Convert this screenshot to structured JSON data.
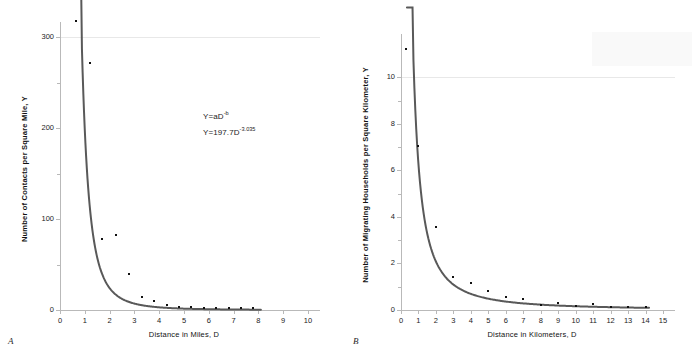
{
  "figure": {
    "background": "#ffffff",
    "curve_color": "#595959",
    "marker_color": "#111111",
    "axis_color": "#b9b9b9",
    "grid_color": "#e8e8e8"
  },
  "panels": [
    {
      "letter": "A",
      "equations": [
        "Y=aD",
        "Y=197.7D"
      ],
      "eq1_base": "Y=aD",
      "eq1_exp": "-b",
      "eq2_base": "Y=197.7D",
      "eq2_exp": "-3.035"
    },
    {
      "letter": "B",
      "eq1_base": "Y=6.26D",
      "eq1_exp": "-1.589"
    }
  ],
  "chart_data": [
    {
      "type": "scatter",
      "panel": "A",
      "title": "",
      "xlabel": "Distance in Miles,  D",
      "ylabel": "Number of Contacts per Square Mile,  Y",
      "xlim": [
        0,
        10
      ],
      "ylim": [
        0,
        310
      ],
      "xticks": [
        0,
        1,
        2,
        3,
        4,
        5,
        6,
        7,
        8,
        9,
        10
      ],
      "xticklabels": [
        "0",
        "1",
        "2",
        "3",
        "4",
        "5",
        "6",
        "7",
        "8",
        "9",
        "10"
      ],
      "yticks": [
        0,
        100,
        200,
        300
      ],
      "yticklabels": [
        "0",
        "100",
        "200",
        "300"
      ],
      "yminor": [
        50,
        150,
        250
      ],
      "grid": "single horizontal gridline at y=300",
      "legend": "none",
      "annotations": [
        "Y=aD^-b",
        "Y=197.7D^-3.035"
      ],
      "fit": {
        "equation": "Y = 197.7 * D^-3.035",
        "a": 197.7,
        "b": -3.035,
        "x_start": 0.8,
        "x_end": 8.1
      },
      "points": {
        "x": [
          0.65,
          1.2,
          1.7,
          2.25,
          2.8,
          3.3,
          3.8,
          4.3,
          4.8,
          5.3,
          5.8,
          6.3,
          6.8,
          7.3,
          7.8
        ],
        "y": [
          318,
          272,
          78,
          82,
          40,
          14,
          10,
          6,
          3,
          3,
          2,
          2,
          2,
          2,
          2
        ]
      }
    },
    {
      "type": "scatter",
      "panel": "B",
      "title": "",
      "xlabel": "Distance in Kilometers,  D",
      "ylabel": "Number of Migrating Households per Square Kilometer,  Y",
      "xlim": [
        0,
        15
      ],
      "ylim": [
        0,
        11.6
      ],
      "xticks": [
        0,
        1,
        2,
        3,
        4,
        5,
        6,
        7,
        8,
        9,
        10,
        11,
        12,
        13,
        14,
        15
      ],
      "xticklabels": [
        "0",
        "1",
        "2",
        "3",
        "4",
        "5",
        "6",
        "7",
        "8",
        "9",
        "10",
        "11",
        "12",
        "13",
        "14",
        "15"
      ],
      "yticks": [
        0,
        2,
        4,
        6,
        8,
        10
      ],
      "yticklabels": [
        "0",
        "2",
        "4",
        "6",
        "8",
        "10"
      ],
      "yminor": [
        1,
        3,
        5,
        7,
        9
      ],
      "grid": "single horizontal gridline at y=10",
      "legend": "none",
      "annotations": [
        "Y=6.26D^-1.589"
      ],
      "fit": {
        "equation": "Y = 6.26 * D^-1.589",
        "a": 6.26,
        "b": -1.589,
        "x_start": 0.34,
        "x_end": 14.2
      },
      "points": {
        "x": [
          0.3,
          1,
          2,
          3,
          4,
          5,
          6,
          7,
          8,
          9,
          10,
          11,
          12,
          13,
          14
        ],
        "y": [
          11.2,
          7.05,
          3.55,
          1.4,
          1.15,
          0.82,
          0.57,
          0.47,
          0.23,
          0.3,
          0.18,
          0.25,
          0.14,
          0.13,
          0.13
        ]
      }
    }
  ]
}
